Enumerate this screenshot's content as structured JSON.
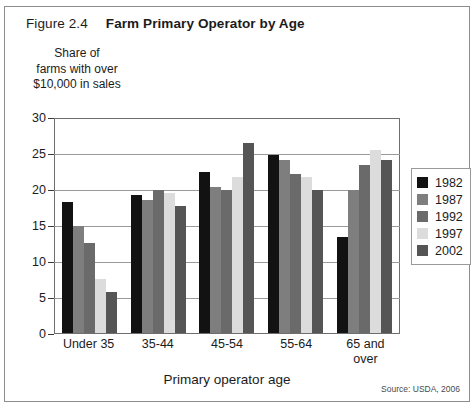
{
  "figure": {
    "number": "Figure 2.4",
    "title": "Farm Primary Operator by Age",
    "source": "Source: USDA, 2006"
  },
  "ylabel_lines": [
    "Share of",
    "farms with over",
    "$10,000 in sales"
  ],
  "colors": {
    "1982": "#121212",
    "1987": "#7e7e7e",
    "1992": "#6a6a6a",
    "1997": "#dcdcdc",
    "2002": "#555555",
    "frame": "#6e6e6e",
    "grid": "#9a9a9a"
  },
  "chart_data": {
    "type": "bar",
    "title": "Farm Primary Operator by Age",
    "xlabel": "Primary operator age",
    "ylabel": "Share of farms with over $10,000 in sales",
    "ylim": [
      0,
      30
    ],
    "yticks": [
      0,
      5,
      10,
      15,
      20,
      25,
      30
    ],
    "grid": true,
    "legend_position": "right",
    "categories": [
      "Under 35",
      "35-44",
      "45-54",
      "55-64",
      "65 and over"
    ],
    "series": [
      {
        "name": "1982",
        "values": [
          18.4,
          19.4,
          22.6,
          24.9,
          13.4
        ]
      },
      {
        "name": "1987",
        "values": [
          15.0,
          18.6,
          20.4,
          24.3,
          20.0
        ]
      },
      {
        "name": "1992",
        "values": [
          12.6,
          20.0,
          20.0,
          22.3,
          23.5
        ]
      },
      {
        "name": "1997",
        "values": [
          7.6,
          19.6,
          21.9,
          21.9,
          25.6
        ]
      },
      {
        "name": "2002",
        "values": [
          5.8,
          17.8,
          26.7,
          20.0,
          24.3
        ]
      }
    ]
  }
}
